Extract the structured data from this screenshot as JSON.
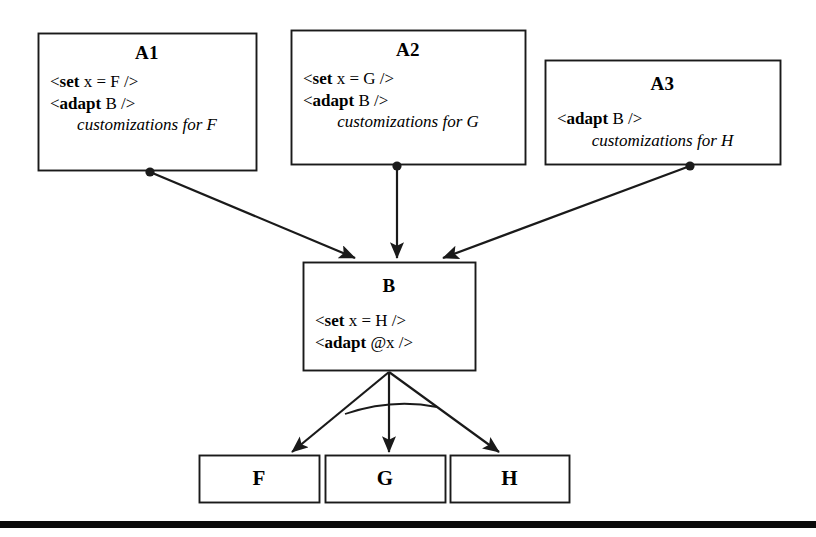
{
  "diagram": {
    "type": "adaptation-flow-diagram",
    "background_color": "#ffffff",
    "stroke_color": "#1a1a1a",
    "nodes": [
      {
        "id": "A1",
        "title": "A1",
        "lines": [
          {
            "style": "code",
            "pre": "<",
            "kw": "set",
            "post": " x = F />"
          },
          {
            "style": "code",
            "pre": "<",
            "kw": "adapt",
            "post": " B />"
          },
          {
            "style": "emph",
            "text": "customizations for F"
          }
        ],
        "x": 38,
        "y": 33,
        "w": 218,
        "h": 137
      },
      {
        "id": "A2",
        "title": "A2",
        "lines": [
          {
            "style": "code",
            "pre": "<",
            "kw": "set",
            "post": " x = G />"
          },
          {
            "style": "code",
            "pre": "<",
            "kw": "adapt",
            "post": " B />"
          },
          {
            "style": "emph",
            "text": "customizations for G"
          }
        ],
        "x": 291,
        "y": 30,
        "w": 234,
        "h": 134
      },
      {
        "id": "A3",
        "title": "A3",
        "lines": [
          {
            "style": "code",
            "pre": "<",
            "kw": "adapt",
            "post": " B />"
          },
          {
            "style": "emph",
            "text": "customizations for H"
          }
        ],
        "x": 545,
        "y": 60,
        "w": 235,
        "h": 104
      },
      {
        "id": "B",
        "title": "B",
        "lines": [
          {
            "style": "code",
            "pre": "<",
            "kw": "set",
            "post": " x = H />"
          },
          {
            "style": "code",
            "pre": "<",
            "kw": "adapt",
            "post": " @x />"
          }
        ],
        "x": 303,
        "y": 262,
        "w": 172,
        "h": 108
      }
    ],
    "leaves": [
      {
        "id": "F",
        "label": "F",
        "x": 199,
        "y": 455,
        "w": 120,
        "h": 47
      },
      {
        "id": "G",
        "label": "G",
        "x": 325,
        "y": 455,
        "w": 120,
        "h": 47
      },
      {
        "id": "H",
        "label": "H",
        "x": 450,
        "y": 455,
        "w": 119,
        "h": 47
      }
    ],
    "edges": [
      {
        "id": "a1-to-b",
        "from": "A1",
        "to": "B",
        "source_marker": "filled-dot",
        "target_marker": "solid-arrowhead",
        "x1": 150,
        "y1": 172,
        "x2": 355,
        "y2": 258
      },
      {
        "id": "a2-to-b",
        "from": "A2",
        "to": "B",
        "source_marker": "filled-dot",
        "target_marker": "solid-arrowhead",
        "x1": 397,
        "y1": 166,
        "x2": 397,
        "y2": 258
      },
      {
        "id": "a3-to-b",
        "from": "A3",
        "to": "B",
        "source_marker": "filled-dot",
        "target_marker": "solid-arrowhead",
        "x1": 690,
        "y1": 166,
        "x2": 443,
        "y2": 258
      },
      {
        "id": "b-to-f",
        "from": "B",
        "to": "F",
        "source_marker": "none",
        "target_marker": "solid-arrowhead",
        "x1": 389,
        "y1": 372,
        "x2": 292,
        "y2": 452
      },
      {
        "id": "b-to-g",
        "from": "B",
        "to": "G",
        "source_marker": "none",
        "target_marker": "solid-arrowhead",
        "x1": 389,
        "y1": 372,
        "x2": 389,
        "y2": 452
      },
      {
        "id": "b-to-h",
        "from": "B",
        "to": "H",
        "source_marker": "none",
        "target_marker": "solid-arrowhead",
        "x1": 389,
        "y1": 372,
        "x2": 499,
        "y2": 452
      }
    ],
    "choice_arc": {
      "id": "alternative-choice-arc",
      "description": "arc crossing the three outgoing branches",
      "path": "M 345 414 Q 392 398 437 407"
    },
    "bottom_rule": {
      "x": 0,
      "y": 521,
      "w": 816,
      "h": 7,
      "color": "#0a0a0a"
    }
  }
}
